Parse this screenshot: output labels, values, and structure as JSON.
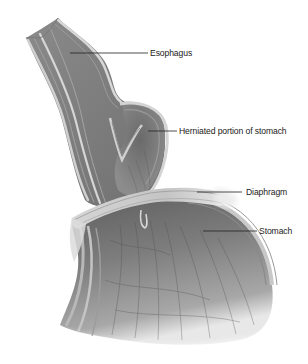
{
  "diagram": {
    "colors": {
      "background": "#ffffff",
      "tissue_dark": "#6e6e6e",
      "tissue_mid": "#9a9a9a",
      "tissue_light": "#c9c9c9",
      "tissue_highlight": "#e6e6e6",
      "label_text": "#222222"
    },
    "labels": [
      {
        "id": "esophagus",
        "text": "Esophagus"
      },
      {
        "id": "herniated",
        "text": "Herniated portion of stomach"
      },
      {
        "id": "diaphragm",
        "text": "Diaphragm"
      },
      {
        "id": "stomach",
        "text": "Stomach"
      }
    ]
  }
}
